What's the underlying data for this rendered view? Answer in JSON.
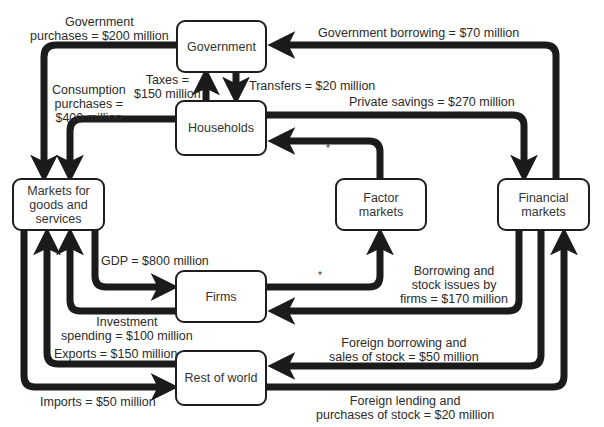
{
  "diagram": {
    "type": "expanded circular-flow diagram",
    "nodes": {
      "government": "Government",
      "households": "Households",
      "markets_goods": "Markets for goods and services",
      "markets_goods_lines": [
        "Markets for",
        "goods and",
        "services"
      ],
      "factor_markets_lines": [
        "Factor",
        "markets"
      ],
      "financial_markets_lines": [
        "Financial",
        "markets"
      ],
      "firms": "Firms",
      "rest_of_world": "Rest of world"
    },
    "flows": {
      "government_purchases": [
        "Government",
        "purchases = $200 million"
      ],
      "government_borrowing": "Government borrowing = $70 million",
      "taxes": [
        "Taxes =",
        "$150 million"
      ],
      "transfers": "Transfers = $20 million",
      "consumption": [
        "Consumption",
        "purchases =",
        "$400 million"
      ],
      "private_savings": "Private savings = $270 million",
      "gdp": "GDP = $800 million",
      "borrowing_firms": [
        "Borrowing and",
        "stock issues by",
        "firms = $170 million"
      ],
      "investment": [
        "Investment",
        "spending = $100 million"
      ],
      "exports": "Exports = $150 million",
      "foreign_borrowing": [
        "Foreign borrowing and",
        "sales of stock = $50 million"
      ],
      "imports": "Imports = $50 million",
      "foreign_lending": [
        "Foreign lending and",
        "purchases of stock = $20 million"
      ],
      "factor_marker": "*"
    },
    "edges": [
      {
        "from": "Government",
        "to": "Markets for goods and services",
        "label": "Government purchases = $200 million"
      },
      {
        "from": "Financial markets",
        "to": "Government",
        "label": "Government borrowing = $70 million"
      },
      {
        "from": "Households",
        "to": "Government",
        "label": "Taxes = $150 million"
      },
      {
        "from": "Government",
        "to": "Households",
        "label": "Transfers = $20 million"
      },
      {
        "from": "Households",
        "to": "Markets for goods and services",
        "label": "Consumption purchases = $400 million"
      },
      {
        "from": "Households",
        "to": "Financial markets",
        "label": "Private savings = $270 million"
      },
      {
        "from": "Factor markets",
        "to": "Households",
        "label": "*"
      },
      {
        "from": "Markets for goods and services",
        "to": "Firms",
        "label": "GDP = $800 million"
      },
      {
        "from": "Firms",
        "to": "Factor markets",
        "label": "*"
      },
      {
        "from": "Financial markets",
        "to": "Firms",
        "label": "Borrowing and stock issues by firms = $170 million"
      },
      {
        "from": "Firms",
        "to": "Markets for goods and services",
        "label": "Investment spending = $100 million"
      },
      {
        "from": "Rest of world",
        "to": "Markets for goods and services",
        "label": "Exports = $150 million"
      },
      {
        "from": "Financial markets",
        "to": "Rest of world",
        "label": "Foreign borrowing and sales of stock = $50 million"
      },
      {
        "from": "Markets for goods and services",
        "to": "Rest of world",
        "label": "Imports = $50 million"
      },
      {
        "from": "Rest of world",
        "to": "Financial markets",
        "label": "Foreign lending and purchases of stock = $20 million"
      }
    ],
    "colors": {
      "arrow": "#1b1b1b",
      "box_border": "#1e1e1e",
      "text": "#2b2b2b",
      "background": "#ffffff"
    }
  }
}
